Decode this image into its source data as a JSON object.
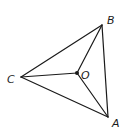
{
  "diagram": {
    "type": "geometry",
    "points": {
      "A": {
        "x": 108,
        "y": 117,
        "label": "A",
        "lx": 112,
        "ly": 127
      },
      "B": {
        "x": 102,
        "y": 25,
        "label": "B",
        "lx": 107,
        "ly": 24
      },
      "C": {
        "x": 21,
        "y": 77,
        "label": "C",
        "lx": 7,
        "ly": 83
      },
      "O": {
        "x": 77,
        "y": 73,
        "label": "O",
        "lx": 81,
        "ly": 79
      }
    },
    "segments": [
      [
        "A",
        "B"
      ],
      [
        "B",
        "C"
      ],
      [
        "C",
        "A"
      ],
      [
        "O",
        "A"
      ],
      [
        "O",
        "B"
      ],
      [
        "O",
        "C"
      ]
    ],
    "stroke_color": "#1a1a1a"
  }
}
